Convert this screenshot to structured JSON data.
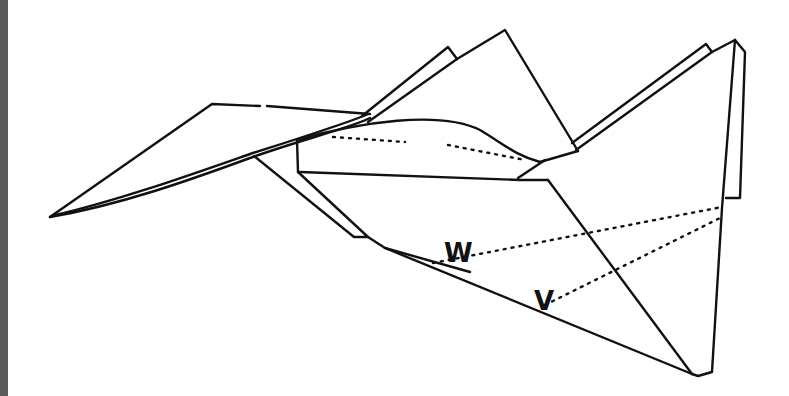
{
  "figure": {
    "labels": {
      "w": "W",
      "v": "V"
    },
    "colors": {
      "line": "#111111",
      "background": "#ffffff",
      "left_bar": "#5a5a5a"
    }
  }
}
